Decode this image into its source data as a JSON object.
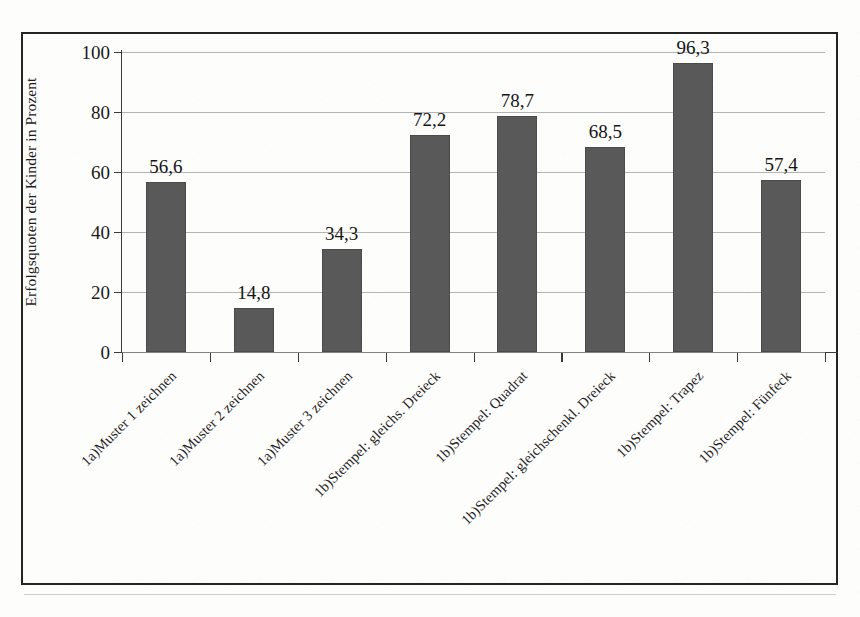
{
  "chart_data": {
    "type": "bar",
    "title": "",
    "xlabel": "",
    "ylabel": "Erfolgsquoten der Kinder in Prozent",
    "ylim": [
      0,
      100
    ],
    "yticks": [
      0,
      20,
      40,
      60,
      80,
      100
    ],
    "grid": true,
    "legend": "none",
    "label_rotation": -45,
    "value_decimal_separator": ",",
    "categories": [
      "1a)Muster 1 zeichnen",
      "1a)Muster 2 zeichnen",
      "1a)Muster 3 zeichnen",
      "1b)Stempel: gleichs. Dreieck",
      "1b)Stempel: Quadrat",
      "1b)Stempel: gleichschenkl. Dreieck",
      "1b)Stempel: Trapez",
      "1b)Stempel: Fünfeck"
    ],
    "values": [
      56.6,
      14.8,
      34.3,
      72.2,
      78.7,
      68.5,
      96.3,
      57.4
    ],
    "value_labels": [
      "56,6",
      "14,8",
      "34,3",
      "72,2",
      "78,7",
      "68,5",
      "96,3",
      "57,4"
    ],
    "tick_labels": [
      "100",
      "80",
      "60",
      "40",
      "20",
      "0"
    ],
    "colors": {
      "bar_fill": "#595959",
      "plot_background": "#fdfdfc",
      "gridline": "#9b9b9b",
      "axis": "#3a3a3a",
      "frame": "#242424",
      "text": "#1a1a1a"
    }
  },
  "figure": {
    "bottom_cut_text": ""
  }
}
